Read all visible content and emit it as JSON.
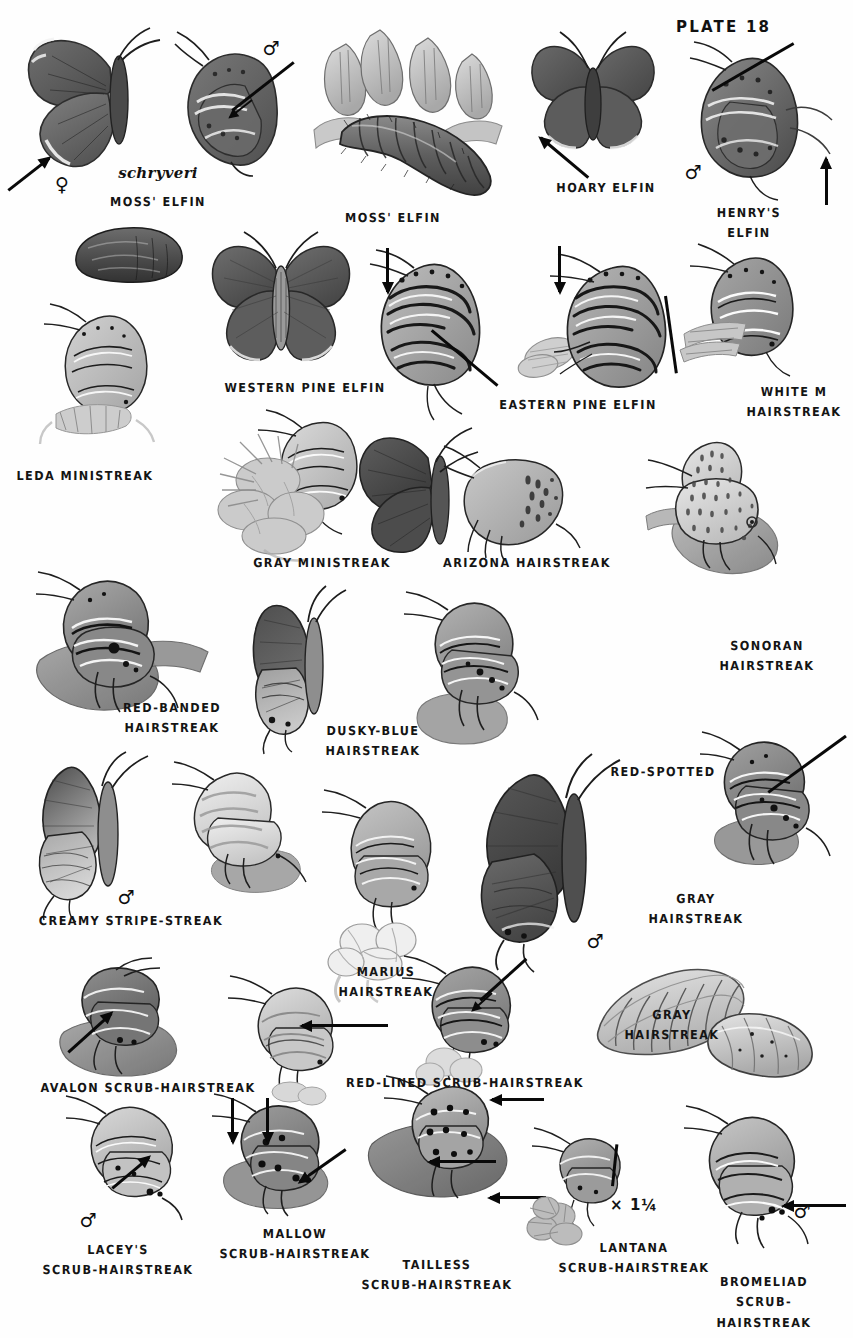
{
  "plate": {
    "number_label": "PLATE 18",
    "scale_note": "× 1¼",
    "subspecies_name": "schryveri",
    "symbols": {
      "male": "♂",
      "female": "♀"
    }
  },
  "captions": [
    {
      "id": "moss-elfin-adult",
      "text": "MOSS' ELFIN",
      "x": 158,
      "y": 192
    },
    {
      "id": "moss-elfin-larva",
      "text": "MOSS' ELFIN",
      "x": 393,
      "y": 208
    },
    {
      "id": "hoary-elfin",
      "text": "HOARY ELFIN",
      "x": 606,
      "y": 178
    },
    {
      "id": "henrys-elfin",
      "text": "HENRY'S ELFIN",
      "x": 749,
      "y": 203
    },
    {
      "id": "western-pine-elfin",
      "text": "WESTERN PINE ELFIN",
      "x": 305,
      "y": 378
    },
    {
      "id": "eastern-pine-elfin",
      "text": "EASTERN PINE ELFIN",
      "x": 578,
      "y": 395
    },
    {
      "id": "white-m-hairstreak",
      "text": "WHITE M\nHAIRSTREAK",
      "x": 794,
      "y": 382
    },
    {
      "id": "leda-ministreak",
      "text": "LEDA MINISTREAK",
      "x": 85,
      "y": 466
    },
    {
      "id": "gray-ministreak",
      "text": "GRAY MINISTREAK",
      "x": 322,
      "y": 553
    },
    {
      "id": "arizona-hairstreak",
      "text": "ARIZONA HAIRSTREAK",
      "x": 527,
      "y": 553
    },
    {
      "id": "sonoran-hairstreak",
      "text": "SONORAN\nHAIRSTREAK",
      "x": 767,
      "y": 636
    },
    {
      "id": "red-banded-hairstreak",
      "text": "RED-BANDED\nHAIRSTREAK",
      "x": 172,
      "y": 698
    },
    {
      "id": "dusky-blue-hairstreak",
      "text": "DUSKY-BLUE\nHAIRSTREAK",
      "x": 373,
      "y": 721
    },
    {
      "id": "red-spotted",
      "text": "RED-SPOTTED",
      "x": 663,
      "y": 762
    },
    {
      "id": "gray-hairstreak-adult",
      "text": "GRAY\nHAIRSTREAK",
      "x": 696,
      "y": 889
    },
    {
      "id": "creamy-stripe-streak",
      "text": "CREAMY STRIPE-STREAK",
      "x": 131,
      "y": 911
    },
    {
      "id": "marius-hairstreak",
      "text": "MARIUS\nHAIRSTREAK",
      "x": 386,
      "y": 962
    },
    {
      "id": "avalon-scrub-hairstreak",
      "text": "AVALON SCRUB-HAIRSTREAK",
      "x": 148,
      "y": 1078
    },
    {
      "id": "red-lined-scrub-hairstreak",
      "text": "RED-LINED SCRUB-HAIRSTREAK",
      "x": 465,
      "y": 1073
    },
    {
      "id": "gray-hairstreak-larva",
      "text": "GRAY\nHAIRSTREAK",
      "x": 672,
      "y": 1005
    },
    {
      "id": "laceys-scrub-hairstreak",
      "text": "LACEY'S\nSCRUB-HAIRSTREAK",
      "x": 118,
      "y": 1240
    },
    {
      "id": "mallow-scrub-hairstreak",
      "text": "MALLOW\nSCRUB-HAIRSTREAK",
      "x": 295,
      "y": 1224
    },
    {
      "id": "tailless-scrub-hairstreak",
      "text": "TAILLESS\nSCRUB-HAIRSTREAK",
      "x": 437,
      "y": 1255
    },
    {
      "id": "lantana-scrub-hairstreak",
      "text": "LANTANA\nSCRUB-HAIRSTREAK",
      "x": 634,
      "y": 1238
    },
    {
      "id": "bromeliad-scrub-hairstreak",
      "text": "BROMELIAD\nSCRUB-HAIRSTREAK",
      "x": 764,
      "y": 1272
    }
  ],
  "sex_symbols": [
    {
      "id": "moss-elfin-female",
      "symbol": "♀",
      "x": 62,
      "y": 184
    },
    {
      "id": "moss-elfin-male",
      "symbol": "♂",
      "x": 271,
      "y": 48
    },
    {
      "id": "henrys-elfin-male",
      "symbol": "♂",
      "x": 693,
      "y": 172
    },
    {
      "id": "creamy-stripe-male",
      "symbol": "♂",
      "x": 126,
      "y": 897
    },
    {
      "id": "gray-hairstreak-male",
      "symbol": "♂",
      "x": 595,
      "y": 941
    },
    {
      "id": "laceys-male",
      "symbol": "♂",
      "x": 88,
      "y": 1220
    },
    {
      "id": "bromeliad-male",
      "symbol": "♂",
      "x": 802,
      "y": 1211
    }
  ]
}
